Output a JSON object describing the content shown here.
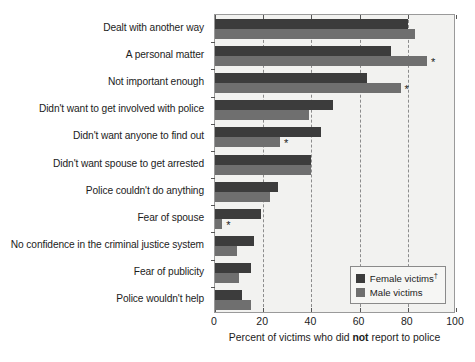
{
  "chart_data": {
    "type": "bar",
    "orientation": "horizontal",
    "title": "",
    "xlabel": "Percent of victims who did not report to police",
    "xlabel_bold_word": "not",
    "ylabel": "",
    "xlim": [
      0,
      100
    ],
    "xticks": [
      0,
      20,
      40,
      60,
      80,
      100
    ],
    "grid": "vertical dashed gridlines at 20, 40, 60, 80",
    "legend_position": "lower right",
    "categories": [
      "Dealt with another way",
      "A personal matter",
      "Not important enough",
      "Didn't want to get involved with police",
      "Didn't want anyone to find out",
      "Didn't want spouse to get arrested",
      "Police couldn't do anything",
      "Fear of spouse",
      "No confidence in the criminal justice system",
      "Fear of publicity",
      "Police wouldn't help"
    ],
    "series": [
      {
        "name": "Female victims",
        "color": "#3c3c3c",
        "values": [
          80,
          73,
          63,
          49,
          44,
          40,
          26,
          19,
          16,
          15,
          11
        ]
      },
      {
        "name": "Male victims",
        "color": "#6f6f6f",
        "values": [
          83,
          88,
          77,
          39,
          27,
          40,
          23,
          3,
          9,
          10,
          15
        ]
      }
    ],
    "significance_markers": [
      {
        "category": "A personal matter",
        "series": "Male victims",
        "value": 88,
        "symbol": "*"
      },
      {
        "category": "Not important enough",
        "series": "Male victims",
        "value": 77,
        "symbol": "*"
      },
      {
        "category": "Didn't want anyone to find out",
        "series": "Male victims",
        "value": 27,
        "symbol": "*"
      },
      {
        "category": "Fear of spouse",
        "series": "Male victims",
        "value": 3,
        "symbol": "*"
      }
    ],
    "legend_entries": [
      {
        "label": "Female victims",
        "superscript": "†",
        "color": "#3c3c3c"
      },
      {
        "label": "Male victims",
        "superscript": "",
        "color": "#6f6f6f"
      }
    ]
  },
  "axis": {
    "tick_labels": [
      "0",
      "20",
      "40",
      "60",
      "80",
      "100"
    ]
  },
  "legend": {
    "female_label": "Female victims",
    "female_dagger": "†",
    "male_label": "Male victims"
  },
  "colors": {
    "female_bar": "#3c3c3c",
    "male_bar": "#6f6f6f",
    "plot_background": "#f2f2f0",
    "gridline": "#8c8c8c",
    "axis_border": "#9a9a9a"
  }
}
